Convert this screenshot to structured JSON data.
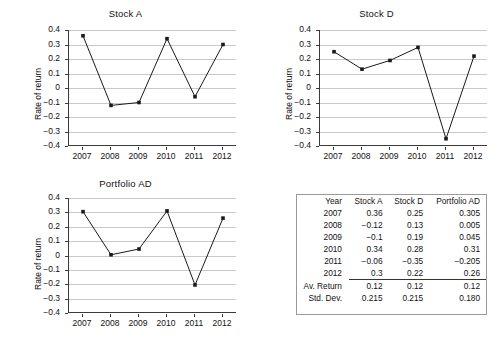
{
  "figure": {
    "background": "#ffffff",
    "line_color": "#1a1a1a",
    "grid_color": "#c9c9c9",
    "axis_color": "#3a3a3a"
  },
  "charts": [
    {
      "id": "stock-a",
      "title": "Stock A",
      "ylabel": "Rate of return",
      "xlabel": "",
      "categories": [
        "2007",
        "2008",
        "2009",
        "2010",
        "2011",
        "2012"
      ],
      "values": [
        0.36,
        -0.12,
        -0.1,
        0.34,
        -0.06,
        0.3
      ],
      "yticks": [
        "0.4",
        "0.3",
        "0.2",
        "0.1",
        "0",
        "−0.1",
        "−0.2",
        "−0.3",
        "−0.4"
      ],
      "ylim": [
        -0.4,
        0.4
      ]
    },
    {
      "id": "stock-d",
      "title": "Stock D",
      "ylabel": "Rate of return",
      "xlabel": "",
      "categories": [
        "2007",
        "2008",
        "2009",
        "2010",
        "2011",
        "2012"
      ],
      "values": [
        0.25,
        0.13,
        0.19,
        0.28,
        -0.35,
        0.22
      ],
      "yticks": [
        "0.4",
        "0.3",
        "0.2",
        "0.1",
        "0",
        "−0.1",
        "−0.2",
        "−0.3",
        "−0.4"
      ],
      "ylim": [
        -0.4,
        0.4
      ]
    },
    {
      "id": "portfolio-ad",
      "title": "Portfolio AD",
      "ylabel": "Rate of return",
      "xlabel": "",
      "categories": [
        "2007",
        "2008",
        "2009",
        "2010",
        "2011",
        "2012"
      ],
      "values": [
        0.305,
        0.005,
        0.045,
        0.31,
        -0.205,
        0.26
      ],
      "yticks": [
        "0.4",
        "0.3",
        "0.2",
        "0.1",
        "0",
        "−0.1",
        "−0.2",
        "−0.3",
        "−0.4"
      ],
      "ylim": [
        -0.4,
        0.4
      ]
    }
  ],
  "chart_data": [
    {
      "type": "line",
      "title": "Stock A",
      "xlabel": "",
      "ylabel": "Rate of return",
      "categories": [
        "2007",
        "2008",
        "2009",
        "2010",
        "2011",
        "2012"
      ],
      "values": [
        0.36,
        -0.12,
        -0.1,
        0.34,
        -0.06,
        0.3
      ],
      "ylim": [
        -0.4,
        0.4
      ],
      "ytick_step": 0.1,
      "grid": "horizontal",
      "legend": "none",
      "marker": "square"
    },
    {
      "type": "line",
      "title": "Stock D",
      "xlabel": "",
      "ylabel": "Rate of return",
      "categories": [
        "2007",
        "2008",
        "2009",
        "2010",
        "2011",
        "2012"
      ],
      "values": [
        0.25,
        0.13,
        0.19,
        0.28,
        -0.35,
        0.22
      ],
      "ylim": [
        -0.4,
        0.4
      ],
      "ytick_step": 0.1,
      "grid": "horizontal",
      "legend": "none",
      "marker": "square"
    },
    {
      "type": "line",
      "title": "Portfolio AD",
      "xlabel": "",
      "ylabel": "Rate of return",
      "categories": [
        "2007",
        "2008",
        "2009",
        "2010",
        "2011",
        "2012"
      ],
      "values": [
        0.305,
        0.005,
        0.045,
        0.31,
        -0.205,
        0.26
      ],
      "ylim": [
        -0.4,
        0.4
      ],
      "ytick_step": 0.1,
      "grid": "horizontal",
      "legend": "none",
      "marker": "square"
    },
    {
      "type": "table",
      "title": "",
      "columns": [
        "Year",
        "Stock A",
        "Stock D",
        "Portfolio AD"
      ],
      "rows": [
        [
          "2007",
          "0.36",
          "0.25",
          "0.305"
        ],
        [
          "2008",
          "−0.12",
          "0.13",
          "0.005"
        ],
        [
          "2009",
          "−0.1",
          "0.19",
          "0.045"
        ],
        [
          "2010",
          "0.34",
          "0.28",
          "0.31"
        ],
        [
          "2011",
          "−0.06",
          "−0.35",
          "−0.205"
        ],
        [
          "2012",
          "0.3",
          "0.22",
          "0.26"
        ]
      ],
      "summary_rows": [
        [
          "Av. Return",
          "0.12",
          "0.12",
          "0.12"
        ],
        [
          "Std. Dev.",
          "0.215",
          "0.215",
          "0.180"
        ]
      ]
    }
  ],
  "table": {
    "columns": [
      "Year",
      "Stock A",
      "Stock D",
      "Portfolio AD"
    ],
    "rows": [
      {
        "year": "2007",
        "a": "0.36",
        "d": "0.25",
        "p": "0.305"
      },
      {
        "year": "2008",
        "a": "−0.12",
        "d": "0.13",
        "p": "0.005"
      },
      {
        "year": "2009",
        "a": "−0.1",
        "d": "0.19",
        "p": "0.045"
      },
      {
        "year": "2010",
        "a": "0.34",
        "d": "0.28",
        "p": "0.31"
      },
      {
        "year": "2011",
        "a": "−0.06",
        "d": "−0.35",
        "p": "−0.205"
      },
      {
        "year": "2012",
        "a": "0.3",
        "d": "0.22",
        "p": "0.26"
      }
    ],
    "summary": [
      {
        "label": "Av. Return",
        "a": "0.12",
        "d": "0.12",
        "p": "0.12"
      },
      {
        "label": "Std. Dev.",
        "a": "0.215",
        "d": "0.215",
        "p": "0.180"
      }
    ]
  }
}
